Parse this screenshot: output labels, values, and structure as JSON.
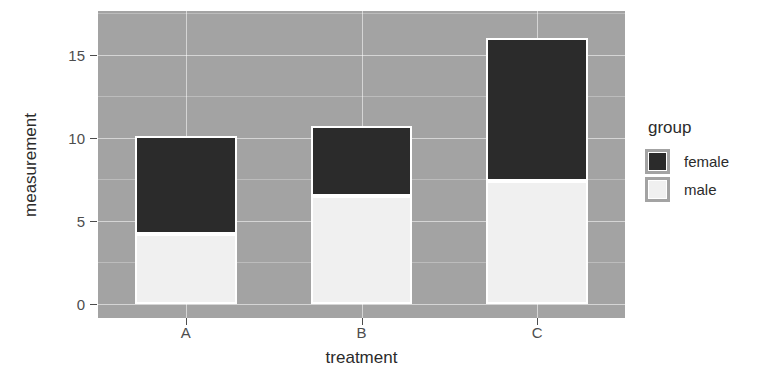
{
  "chart_data": {
    "type": "bar",
    "barmode": "stacked",
    "title": "",
    "xlabel": "treatment",
    "ylabel": "measurement",
    "categories": [
      "A",
      "B",
      "C"
    ],
    "series": [
      {
        "name": "male",
        "color": "#f0f0f0",
        "values": [
          4.2,
          6.5,
          7.4
        ]
      },
      {
        "name": "female",
        "color": "#2b2b2b",
        "values": [
          5.9,
          4.2,
          8.6
        ]
      }
    ],
    "stack_totals": [
      10.1,
      10.7,
      16.0
    ],
    "legend": {
      "title": "group",
      "position": "right",
      "entries": [
        {
          "label": "female",
          "color": "#2b2b2b"
        },
        {
          "label": "male",
          "color": "#f0f0f0"
        }
      ]
    },
    "yaxis": {
      "ticks": [
        "0",
        "5",
        "10",
        "15"
      ],
      "tick_values": [
        0,
        5,
        10,
        15
      ],
      "minor_tick_values": [
        2.5,
        7.5,
        12.5,
        17.5
      ],
      "ylim": [
        -0.85,
        17.65
      ]
    },
    "xaxis": {
      "ticks": [
        "A",
        "B",
        "C"
      ]
    },
    "grid": true,
    "panel_background": "#a3a3a3",
    "grid_color": "#ffffff",
    "plot_background": "#ffffff"
  }
}
